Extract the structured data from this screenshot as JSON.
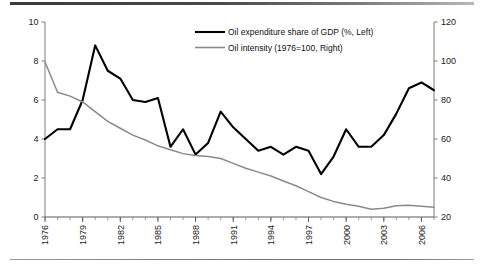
{
  "chart_data": {
    "type": "line",
    "title": "",
    "xlabel": "",
    "ylabel": "",
    "grid": false,
    "legend_position": "top-center",
    "x": [
      1976,
      1977,
      1978,
      1979,
      1980,
      1981,
      1982,
      1983,
      1984,
      1985,
      1986,
      1987,
      1988,
      1989,
      1990,
      1991,
      1992,
      1993,
      1994,
      1995,
      1996,
      1997,
      1998,
      1999,
      2000,
      2001,
      2002,
      2003,
      2004,
      2005,
      2006,
      2007
    ],
    "x_tick_labels": [
      "1976",
      "1979",
      "1982",
      "1985",
      "1988",
      "1991",
      "1994",
      "1997",
      "2000",
      "2003",
      "2006"
    ],
    "x_tick_values": [
      1976,
      1979,
      1982,
      1985,
      1988,
      1991,
      1994,
      1997,
      2000,
      2003,
      2006
    ],
    "axes": {
      "left": {
        "label": "Oil expenditure share of GDP (%, Left)",
        "ticks": [
          0,
          2,
          4,
          6,
          8,
          10
        ],
        "tick_labels": [
          "0",
          "2",
          "4",
          "6",
          "8",
          "10"
        ],
        "ylim": [
          0,
          10
        ]
      },
      "right": {
        "label": "Oil intensity (1976=100, Right)",
        "ticks": [
          20,
          40,
          60,
          80,
          100,
          120
        ],
        "tick_labels": [
          "20",
          "40",
          "60",
          "80",
          "100",
          "120"
        ],
        "ylim": [
          20,
          120
        ]
      }
    },
    "series": [
      {
        "name": "Oil expenditure share of GDP (%, Left)",
        "axis": "left",
        "color": "#000000",
        "width": 2.1,
        "values": [
          4.0,
          4.5,
          4.5,
          6.0,
          8.8,
          7.5,
          7.1,
          6.0,
          5.9,
          6.1,
          3.6,
          4.5,
          3.2,
          3.8,
          5.4,
          4.6,
          4.0,
          3.4,
          3.6,
          3.2,
          3.6,
          3.4,
          2.2,
          3.1,
          4.5,
          3.6,
          3.6,
          4.2,
          5.3,
          6.6,
          6.9,
          6.5
        ]
      },
      {
        "name": "Oil intensity (1976=100, Right)",
        "axis": "right",
        "color": "#8a8a8a",
        "width": 1.5,
        "values": [
          99.5,
          84.0,
          82.0,
          79.0,
          74.0,
          69.0,
          65.5,
          62.0,
          59.5,
          56.5,
          54.5,
          52.5,
          51.5,
          51.0,
          50.0,
          47.5,
          45.0,
          43.0,
          41.0,
          38.5,
          36.0,
          33.0,
          30.0,
          28.0,
          26.5,
          25.5,
          24.0,
          24.5,
          25.8,
          26.0,
          25.5,
          25.0
        ]
      }
    ]
  },
  "legend": {
    "items": [
      {
        "label": "Oil expenditure share of GDP (%, Left)",
        "color": "#000000",
        "width": 2.1
      },
      {
        "label": "Oil intensity (1976=100, Right)",
        "color": "#8a8a8a",
        "width": 1.6
      }
    ]
  }
}
